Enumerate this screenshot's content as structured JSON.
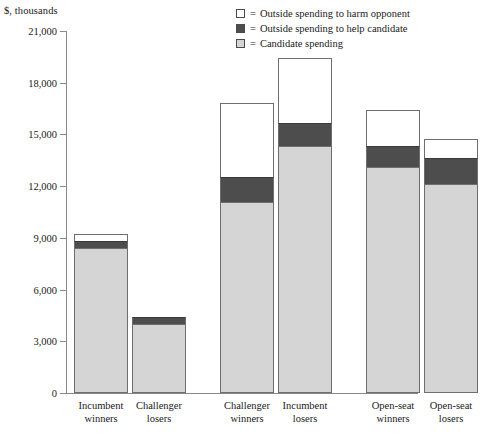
{
  "chart_data": {
    "type": "bar",
    "title": "",
    "subtitle": "",
    "ylabel": "$, thousands",
    "xlabel": "",
    "ylim": [
      0,
      21000
    ],
    "yticks": [
      0,
      3000,
      6000,
      9000,
      12000,
      15000,
      18000,
      21000
    ],
    "ytick_labels": [
      "0",
      "3,000",
      "6,000",
      "9,000",
      "12,000",
      "15,000",
      "18,000",
      "21,000"
    ],
    "grid": false,
    "stacked": true,
    "legend_position": "top-right",
    "categories": [
      "Incumbent winners",
      "Challenger losers",
      "Challenger winners",
      "Incumbent losers",
      "Open-seat winners",
      "Open-seat losers"
    ],
    "category_lines": [
      [
        "Incumbent",
        "winners"
      ],
      [
        "Challenger",
        "losers"
      ],
      [
        "Challenger",
        "winners"
      ],
      [
        "Incumbent",
        "losers"
      ],
      [
        "Open-seat",
        "winners"
      ],
      [
        "Open-seat",
        "losers"
      ]
    ],
    "groups": [
      {
        "name": "Incumbent winners vs Challenger losers",
        "categories": [
          0,
          1
        ]
      },
      {
        "name": "Challenger winners vs Incumbent losers",
        "categories": [
          2,
          3
        ]
      },
      {
        "name": "Open-seat winners vs Open-seat losers",
        "categories": [
          4,
          5
        ]
      }
    ],
    "series": [
      {
        "name": "Candidate spending",
        "color": "#d5d5d5",
        "values": [
          8420,
          4030,
          11090,
          14350,
          13100,
          12100
        ]
      },
      {
        "name": "Outside spending to help candidate",
        "color": "#4d4d4d",
        "values": [
          410,
          360,
          1420,
          1300,
          1250,
          1540
        ]
      },
      {
        "name": "Outside spending to harm opponent",
        "color": "#ffffff",
        "values": [
          400,
          0,
          4330,
          3800,
          2070,
          1120
        ]
      }
    ],
    "totals": [
      9230,
      4390,
      16840,
      19450,
      16420,
      14760
    ]
  },
  "legend": {
    "equals": "=",
    "items": [
      {
        "swatch": "white-swatch",
        "label": "Outside spending to harm opponent",
        "color": "#ffffff"
      },
      {
        "swatch": "dark-gray-swatch",
        "label": "Outside spending to help candidate",
        "color": "#4d4d4d"
      },
      {
        "swatch": "light-gray-swatch",
        "label": "Candidate spending",
        "color": "#d5d5d5"
      }
    ]
  }
}
